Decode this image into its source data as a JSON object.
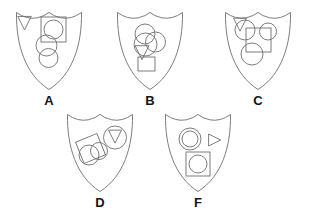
{
  "figure": {
    "background_color": "#ffffff",
    "stroke_color": "#6e6e73",
    "label_color": "#141414",
    "stroke_width": 0.9,
    "shield_count": 5
  },
  "shields": [
    {
      "label": "A",
      "x": 16,
      "y": 12,
      "w": 66,
      "h": 78,
      "label_x": 16,
      "label_y": 92,
      "shapes": [
        {
          "name": "triangle-down",
          "type": "triangle",
          "direction": "down",
          "cx": 24.5,
          "cy": 22.5,
          "size": 13.5
        },
        {
          "name": "square-large",
          "type": "square",
          "x": 41,
          "y": 17,
          "w": 25,
          "h": 25
        },
        {
          "name": "circle-in-square",
          "type": "circle",
          "cx": 53.5,
          "cy": 29.5,
          "r": 9.5
        },
        {
          "name": "circle-middle",
          "type": "circle",
          "cx": 46.5,
          "cy": 45.5,
          "r": 10.5
        },
        {
          "name": "circle-lower",
          "type": "circle",
          "cx": 48.5,
          "cy": 58,
          "r": 9.5
        }
      ]
    },
    {
      "label": "B",
      "x": 117,
      "y": 12,
      "w": 66,
      "h": 78,
      "label_x": 117,
      "label_y": 92,
      "shapes": [
        {
          "name": "circle-upper-left",
          "type": "circle",
          "cx": 145,
          "cy": 34,
          "r": 10
        },
        {
          "name": "circle-lower-left",
          "type": "circle",
          "cx": 145.5,
          "cy": 44.5,
          "r": 11.5
        },
        {
          "name": "circle-right",
          "type": "circle",
          "cx": 155.5,
          "cy": 42,
          "r": 10
        },
        {
          "name": "triangle-down",
          "type": "triangle",
          "direction": "down",
          "cx": 142,
          "cy": 52,
          "size": 14
        },
        {
          "name": "square-bottom",
          "type": "square",
          "x": 138,
          "y": 57,
          "w": 17,
          "h": 14
        }
      ]
    },
    {
      "label": "C",
      "x": 225,
      "y": 12,
      "w": 66,
      "h": 78,
      "label_x": 225,
      "label_y": 92,
      "shapes": [
        {
          "name": "triangle-down",
          "type": "triangle",
          "direction": "down",
          "cx": 240,
          "cy": 24,
          "size": 13
        },
        {
          "name": "circle-top-left",
          "type": "circle",
          "cx": 245,
          "cy": 30,
          "r": 10
        },
        {
          "name": "circle-top-right",
          "type": "circle",
          "cx": 268,
          "cy": 31.5,
          "r": 8.5
        },
        {
          "name": "square-center",
          "type": "square",
          "x": 246,
          "y": 28,
          "w": 25,
          "h": 24
        },
        {
          "name": "circle-bottom",
          "type": "circle",
          "cx": 252,
          "cy": 54,
          "r": 11
        }
      ]
    },
    {
      "label": "D",
      "x": 67,
      "y": 114,
      "w": 66,
      "h": 78,
      "label_x": 67,
      "label_y": 194,
      "shapes": [
        {
          "name": "square-rotated",
          "type": "square",
          "x": 79,
          "y": 137,
          "w": 23,
          "h": 23,
          "rotation": -22
        },
        {
          "name": "circle-left",
          "type": "circle",
          "cx": 89,
          "cy": 155,
          "r": 10
        },
        {
          "name": "circle-right",
          "type": "circle",
          "cx": 99,
          "cy": 151,
          "r": 8.5
        },
        {
          "name": "circle-top-right",
          "type": "circle",
          "cx": 115,
          "cy": 137.5,
          "r": 11.5
        },
        {
          "name": "triangle-in-circle",
          "type": "triangle",
          "direction": "down",
          "cx": 115,
          "cy": 136,
          "size": 13
        }
      ]
    },
    {
      "label": "F",
      "x": 165,
      "y": 114,
      "w": 66,
      "h": 78,
      "label_x": 165,
      "label_y": 194,
      "shapes": [
        {
          "name": "circle-outer",
          "type": "circle",
          "cx": 190,
          "cy": 139,
          "r": 11
        },
        {
          "name": "circle-inner",
          "type": "circle",
          "cx": 190,
          "cy": 139,
          "r": 8
        },
        {
          "name": "triangle-right",
          "type": "triangle",
          "direction": "right",
          "cx": 214,
          "cy": 140,
          "size": 12
        },
        {
          "name": "square-bottom",
          "type": "square",
          "x": 186,
          "y": 152,
          "w": 24,
          "h": 24
        },
        {
          "name": "circle-in-square",
          "type": "circle",
          "cx": 198,
          "cy": 164,
          "r": 9
        }
      ]
    }
  ]
}
